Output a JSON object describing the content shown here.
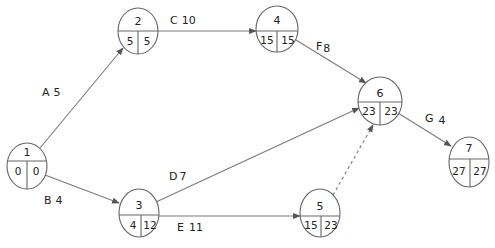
{
  "diagram": {
    "title": "",
    "type": "project-network",
    "colors": {
      "line": "#7a7a7a",
      "node_stroke": "#666666",
      "text": "#222222",
      "background": "#ffffff"
    },
    "nodes": [
      {
        "id": "1",
        "label": "1",
        "earliest": "0",
        "latest": "0"
      },
      {
        "id": "2",
        "label": "2",
        "earliest": "5",
        "latest": "5"
      },
      {
        "id": "3",
        "label": "3",
        "earliest": "4",
        "latest": "12"
      },
      {
        "id": "4",
        "label": "4",
        "earliest": "15",
        "latest": "15"
      },
      {
        "id": "5",
        "label": "5",
        "earliest": "15",
        "latest": "23"
      },
      {
        "id": "6",
        "label": "6",
        "earliest": "23",
        "latest": "23"
      },
      {
        "id": "7",
        "label": "7",
        "earliest": "27",
        "latest": "27"
      }
    ],
    "edges": [
      {
        "from": "1",
        "to": "2",
        "activity": "A",
        "duration": "5",
        "dummy": false
      },
      {
        "from": "1",
        "to": "3",
        "activity": "B",
        "duration": "4",
        "dummy": false
      },
      {
        "from": "2",
        "to": "4",
        "activity": "C",
        "duration": "10",
        "dummy": false
      },
      {
        "from": "3",
        "to": "6",
        "activity": "D",
        "duration": "7",
        "dummy": false
      },
      {
        "from": "3",
        "to": "5",
        "activity": "E",
        "duration": "11",
        "dummy": false
      },
      {
        "from": "4",
        "to": "6",
        "activity": "F",
        "duration": "8",
        "dummy": false
      },
      {
        "from": "6",
        "to": "7",
        "activity": "G",
        "duration": "4",
        "dummy": false
      },
      {
        "from": "5",
        "to": "6",
        "activity": "",
        "duration": "",
        "dummy": true
      }
    ]
  }
}
